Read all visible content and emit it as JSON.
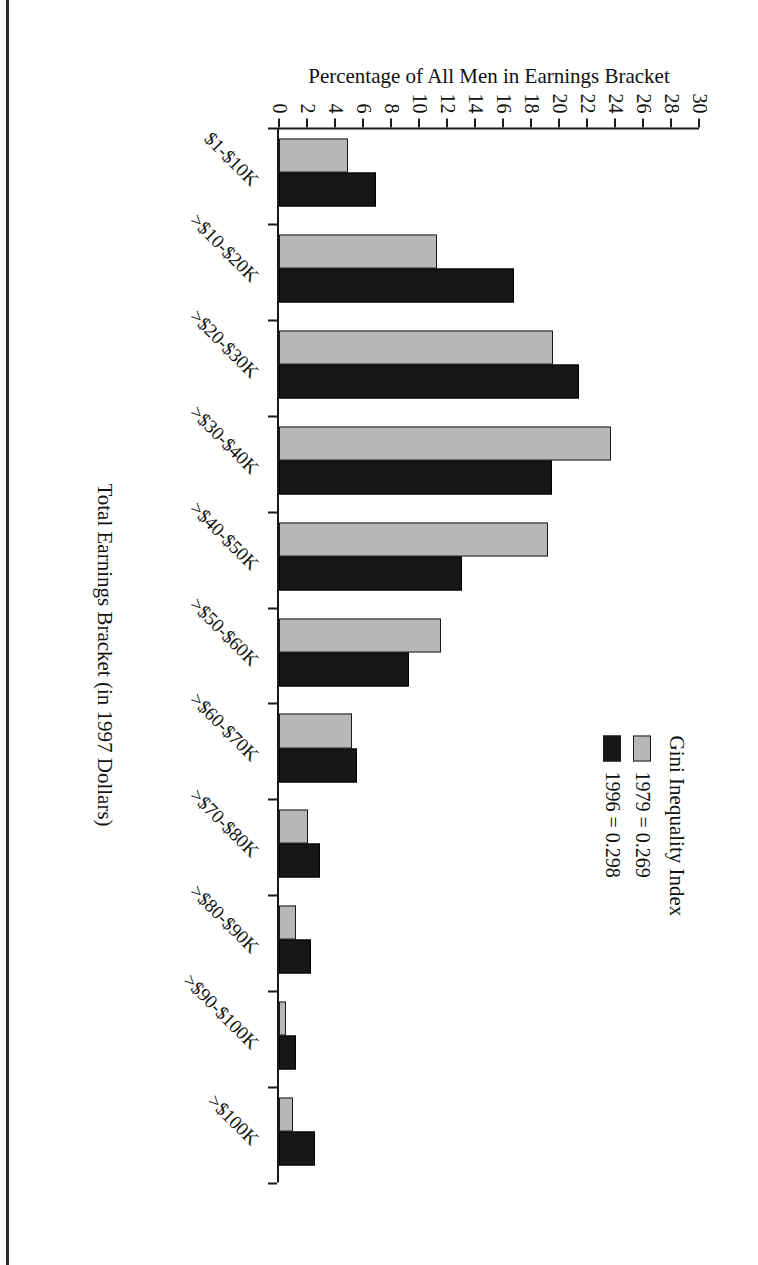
{
  "chart_data": {
    "type": "bar",
    "title": "",
    "xlabel": "Total Earnings Bracket (in 1997 Dollars)",
    "ylabel": "Percentage of All Men in Earnings Bracket",
    "ylim": [
      0,
      30
    ],
    "ytick_step": 2,
    "yticks": [
      "0",
      "2",
      "4",
      "6",
      "8",
      "10",
      "12",
      "14",
      "16",
      "18",
      "20",
      "22",
      "24",
      "26",
      "28",
      "30"
    ],
    "grid": false,
    "legend_position": "upper-right",
    "legend_title": "Gini Inequality Index",
    "orientation": "rotated-90-on-page",
    "categories": [
      "$1-$10K",
      ">$10-$20K",
      ">$20-$30K",
      ">$30-$40K",
      ">$40-$50K",
      ">$50-$60K",
      ">$60-$70K",
      ">$70-$80K",
      ">$80-$90K",
      ">$90-$100K",
      ">$100K"
    ],
    "series": [
      {
        "name": "1979 = 0.269",
        "year": "1979",
        "gini": "0.269",
        "color": "#b8b8b8",
        "values": [
          4.9,
          11.3,
          19.6,
          23.7,
          19.2,
          11.6,
          5.2,
          2.1,
          1.2,
          0.5,
          1.0
        ]
      },
      {
        "name": "1996 = 0.298",
        "year": "1996",
        "gini": "0.298",
        "color": "#171717",
        "values": [
          6.9,
          16.8,
          21.4,
          19.5,
          13.1,
          9.3,
          5.6,
          2.9,
          2.3,
          1.2,
          2.6
        ]
      }
    ]
  },
  "legend": {
    "title": "Gini Inequality Index",
    "entries": [
      {
        "label": "1979 = 0.269"
      },
      {
        "label": "1996 = 0.298"
      }
    ]
  },
  "axes": {
    "value_axis_title": "Percentage of All Men in Earnings Bracket",
    "category_axis_title": "Total Earnings Bracket (in 1997 Dollars)"
  }
}
